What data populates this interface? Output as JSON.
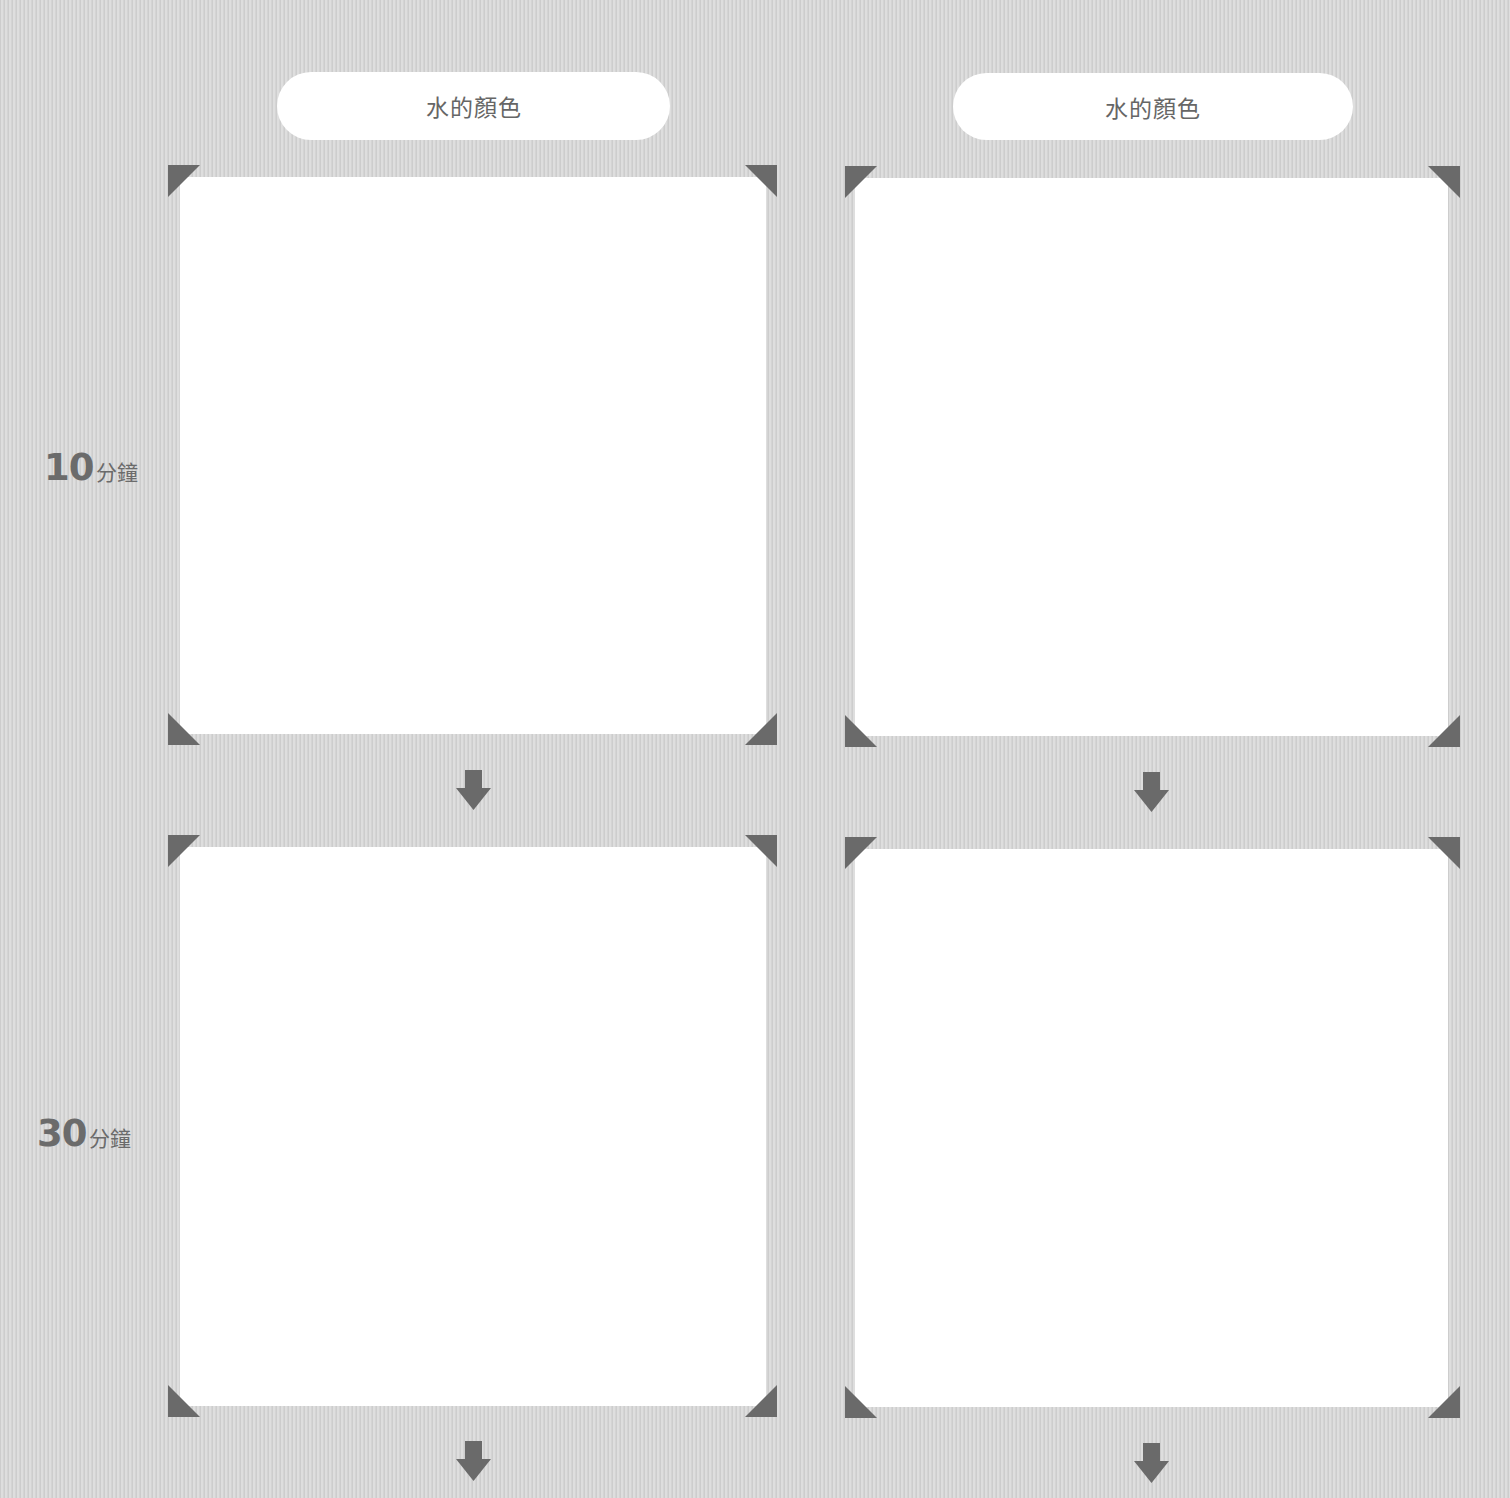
{
  "worksheet": {
    "columns": [
      {
        "header": "水的顏色"
      },
      {
        "header": "水的顏色"
      }
    ],
    "rows": [
      {
        "time_value": "10",
        "time_unit": "分鐘"
      },
      {
        "time_value": "30",
        "time_unit": "分鐘"
      }
    ],
    "icons": {
      "corner_marker": "triangle-corner-icon",
      "flow_arrow": "arrow-down-icon"
    },
    "colors": {
      "background": "#d6d6d6",
      "marker": "#6a6a6a",
      "text": "#666666",
      "box": "#ffffff"
    }
  }
}
